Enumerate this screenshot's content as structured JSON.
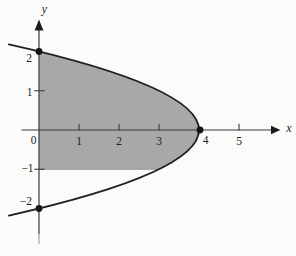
{
  "figure": {
    "background": "#fbfbf9",
    "region_fill": "#a8a8a8",
    "region_bottom_edge_color": "#979797",
    "curve_color": "#202020",
    "axis_color": "#3b3b3b",
    "axis_fade_color": "#9b9b9b",
    "dot_color": "#151515",
    "label_color": "#1d1d1d"
  },
  "plot": {
    "origin_px": [
      39,
      130
    ],
    "unit_px": [
      40,
      39.25
    ],
    "x_axis": {
      "label": "x",
      "zero_label": "0",
      "tick_values": [
        1,
        2,
        3,
        5
      ],
      "tick_labels": [
        "1",
        "2",
        "3",
        "5"
      ],
      "point_label": {
        "value": 4,
        "label": "4"
      }
    },
    "y_axis": {
      "label": "y",
      "tick_values": [
        1,
        -1
      ],
      "tick_labels": [
        "1",
        "−1"
      ],
      "point_labels": [
        {
          "value": 2,
          "label": "2"
        },
        {
          "value": -2,
          "label": "−2"
        }
      ]
    },
    "marked_points": [
      [
        0,
        2
      ],
      [
        4,
        0
      ],
      [
        0,
        -2
      ]
    ]
  },
  "chart_data": {
    "type": "area",
    "title": "",
    "xlabel": "x",
    "ylabel": "y",
    "grid": false,
    "curve": {
      "equation": "x = 4 - y^2",
      "vertex_x": 4,
      "vertex": [
        4,
        0
      ],
      "y_intercepts": [
        [
          0,
          2
        ],
        [
          0,
          -2
        ]
      ],
      "sample_points": [
        [
          0,
          2
        ],
        [
          3,
          1
        ],
        [
          3.75,
          0.5
        ],
        [
          4,
          0
        ],
        [
          3.75,
          -0.5
        ],
        [
          3,
          -1
        ],
        [
          0,
          -2
        ]
      ],
      "draw_span_y": 2.18
    },
    "shaded_region": {
      "description": "Region enclosed by the y-axis (x=0) on the left, the parabola x = 4 - y^2 on the top/right, and the horizontal line y = -1 on the bottom",
      "region_fill_y_range": [
        -1,
        2
      ],
      "boundaries": [
        "x = 0",
        "x = 4 - y^2",
        "y = -1"
      ],
      "fill": "#a8a8a8"
    },
    "marked_points": [
      [
        0,
        2
      ],
      [
        4,
        0
      ],
      [
        0,
        -2
      ]
    ],
    "x_axis": {
      "label": "x",
      "ticks": [
        0,
        1,
        2,
        3,
        4,
        5
      ],
      "range": [
        -0.45,
        5.95
      ]
    },
    "y_axis": {
      "label": "y",
      "ticks": [
        -2,
        -1,
        1,
        2
      ],
      "range": [
        -2.85,
        2.8
      ]
    }
  }
}
